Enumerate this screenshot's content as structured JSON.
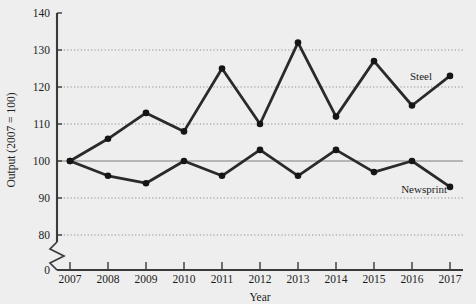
{
  "chart_data": {
    "type": "line",
    "title": "",
    "xlabel": "Year",
    "ylabel": "Output (2007 = 100)",
    "categories": [
      "2007",
      "2008",
      "2009",
      "2010",
      "2011",
      "2012",
      "2013",
      "2014",
      "2015",
      "2016",
      "2017"
    ],
    "x": [
      2007,
      2008,
      2009,
      2010,
      2011,
      2012,
      2013,
      2014,
      2015,
      2016,
      2017
    ],
    "series": [
      {
        "name": "Steel",
        "values": [
          100,
          106,
          113,
          108,
          125,
          110,
          132,
          112,
          127,
          115,
          123
        ]
      },
      {
        "name": "Newsprint",
        "values": [
          100,
          96,
          94,
          100,
          96,
          103,
          96,
          103,
          97,
          100,
          93
        ]
      }
    ],
    "ylim": [
      0,
      140
    ],
    "yticks": [
      0,
      80,
      90,
      100,
      110,
      120,
      130,
      140
    ],
    "ytick_labels": [
      "0",
      "80",
      "90",
      "100",
      "110",
      "120",
      "130",
      "140"
    ],
    "gridlines_dotted": [
      80,
      90,
      110,
      120,
      130
    ],
    "gridline_solid": [
      100
    ],
    "axis_break": true,
    "axis_break_between": [
      0,
      80
    ],
    "grid": true,
    "legend_position": "inline-right",
    "line_color": "#2a2a2a",
    "marker_color": "#151515",
    "grid_color": "#9a9a9a",
    "axis_color": "#3a3a3a",
    "background_color": "#eeeeee"
  },
  "axes": {
    "y_label": "Output (2007 = 100)",
    "x_label": "Year",
    "y_tick_labels": [
      "140",
      "130",
      "120",
      "110",
      "100",
      "90",
      "80",
      "0"
    ],
    "x_tick_labels": [
      "2007",
      "2008",
      "2009",
      "2010",
      "2011",
      "2012",
      "2013",
      "2014",
      "2015",
      "2016",
      "2017"
    ]
  },
  "annotations": {
    "steel_label": "Steel",
    "newsprint_label": "Newsprint"
  }
}
